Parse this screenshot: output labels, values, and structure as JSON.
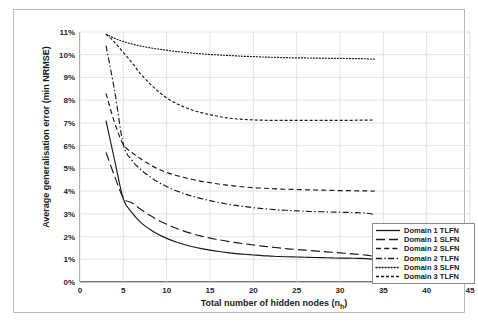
{
  "chart_data": {
    "type": "line",
    "title": "",
    "xlabel": "Total number of hidden nodes (n_h)",
    "ylabel": "Average generalisation error (min NRMSE)",
    "xlim": [
      0,
      45
    ],
    "ylim": [
      0,
      11
    ],
    "xticks": [
      0,
      5,
      10,
      15,
      20,
      25,
      30,
      35,
      40,
      45
    ],
    "yticks": [
      0,
      1,
      2,
      3,
      4,
      5,
      6,
      7,
      8,
      9,
      10,
      11
    ],
    "xtick_labels": [
      "0",
      "5",
      "10",
      "15",
      "20",
      "25",
      "30",
      "35",
      "40",
      "45"
    ],
    "ytick_labels": [
      "0%",
      "1%",
      "2%",
      "3%",
      "4%",
      "5%",
      "6%",
      "7%",
      "8%",
      "9%",
      "10%",
      "11%"
    ],
    "grid": true,
    "legend_position": "lower-right",
    "x": [
      3,
      4,
      5,
      6,
      7,
      8,
      9,
      10,
      11,
      12,
      13,
      14,
      15,
      16,
      17,
      18,
      19,
      20,
      21,
      22,
      23,
      24,
      25,
      26,
      27,
      28,
      29,
      30,
      31,
      32,
      33,
      34
    ],
    "series": [
      {
        "name": "Domain 1 TLFN",
        "dash": "solid",
        "values": [
          7.1,
          5.35,
          3.65,
          3.05,
          2.62,
          2.33,
          2.1,
          1.92,
          1.77,
          1.65,
          1.55,
          1.47,
          1.4,
          1.34,
          1.29,
          1.25,
          1.22,
          1.19,
          1.16,
          1.14,
          1.12,
          1.11,
          1.1,
          1.09,
          1.08,
          1.07,
          1.06,
          1.05,
          1.05,
          1.04,
          1.03,
          1.0
        ]
      },
      {
        "name": "Domain 1 SLFN",
        "dash": "long-dash",
        "values": [
          5.7,
          4.65,
          3.7,
          3.48,
          3.2,
          2.95,
          2.72,
          2.54,
          2.38,
          2.24,
          2.12,
          2.02,
          1.93,
          1.86,
          1.79,
          1.73,
          1.68,
          1.63,
          1.58,
          1.54,
          1.5,
          1.46,
          1.43,
          1.4,
          1.37,
          1.34,
          1.31,
          1.28,
          1.25,
          1.22,
          1.18,
          1.12
        ]
      },
      {
        "name": "Domain 2 SLFN",
        "dash": "medium-dash",
        "values": [
          8.3,
          7.0,
          6.05,
          5.7,
          5.42,
          5.18,
          4.98,
          4.82,
          4.7,
          4.6,
          4.51,
          4.43,
          4.37,
          4.31,
          4.26,
          4.22,
          4.18,
          4.15,
          4.13,
          4.11,
          4.09,
          4.08,
          4.07,
          4.06,
          4.05,
          4.04,
          4.03,
          4.02,
          4.02,
          4.01,
          4.01,
          4.0
        ]
      },
      {
        "name": "Domain 2 TLFN",
        "dash": "dash-dot",
        "values": [
          10.4,
          8.4,
          6.05,
          5.35,
          4.95,
          4.65,
          4.4,
          4.2,
          4.03,
          3.89,
          3.77,
          3.67,
          3.58,
          3.5,
          3.43,
          3.37,
          3.32,
          3.27,
          3.23,
          3.2,
          3.17,
          3.15,
          3.13,
          3.11,
          3.1,
          3.09,
          3.08,
          3.07,
          3.06,
          3.05,
          3.03,
          2.97
        ]
      },
      {
        "name": "Domain 3 SLFN",
        "dash": "dotted",
        "values": [
          10.9,
          10.72,
          10.58,
          10.47,
          10.38,
          10.31,
          10.25,
          10.2,
          10.15,
          10.11,
          10.07,
          10.04,
          10.01,
          9.99,
          9.97,
          9.95,
          9.93,
          9.92,
          9.9,
          9.89,
          9.88,
          9.87,
          9.86,
          9.86,
          9.85,
          9.85,
          9.84,
          9.84,
          9.83,
          9.83,
          9.82,
          9.8
        ]
      },
      {
        "name": "Domain 3 TLFN",
        "dash": "short-dash",
        "values": [
          10.9,
          10.55,
          10.1,
          9.65,
          9.15,
          8.75,
          8.4,
          8.1,
          7.88,
          7.7,
          7.56,
          7.45,
          7.36,
          7.28,
          7.22,
          7.18,
          7.15,
          7.13,
          7.12,
          7.11,
          7.11,
          7.11,
          7.11,
          7.11,
          7.11,
          7.11,
          7.11,
          7.11,
          7.11,
          7.12,
          7.12,
          7.13
        ]
      }
    ]
  },
  "colors": {
    "line": "#1a1a1a",
    "grid": "#d9d9d9",
    "axis": "#808080",
    "text": "#262626",
    "frame": "#b9b9b9"
  }
}
